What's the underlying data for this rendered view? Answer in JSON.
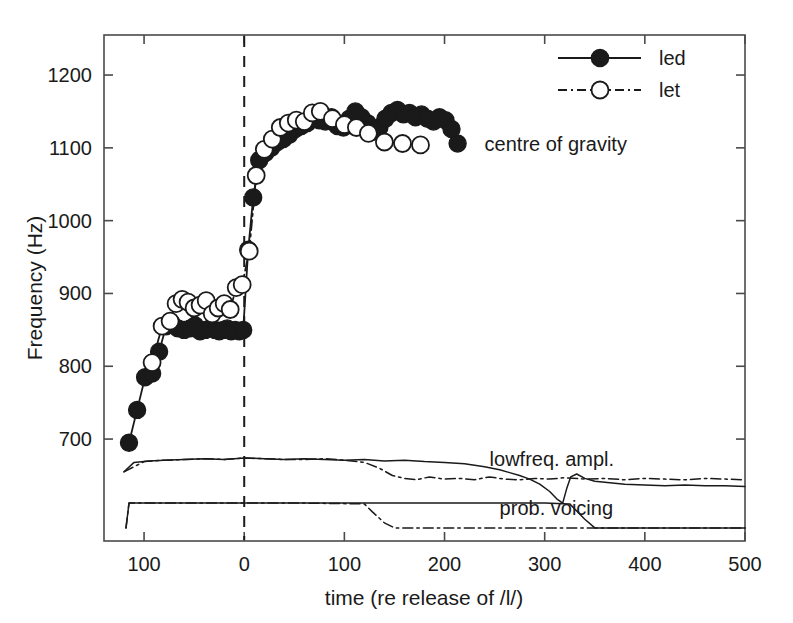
{
  "chart_data": {
    "type": "line",
    "title": "",
    "xlabel": "time (re release of /l/)",
    "ylabel": "Frequency (Hz)",
    "xlim": [
      -140,
      500
    ],
    "ylim": [
      560,
      1255
    ],
    "xticks": [
      -100,
      0,
      100,
      200,
      300,
      400,
      500
    ],
    "xticklabels": [
      "100",
      "0",
      "100",
      "200",
      "300",
      "400",
      "500"
    ],
    "yticks": [
      700,
      800,
      900,
      1000,
      1100,
      1200
    ],
    "yticklabels": [
      "700",
      "800",
      "900",
      "1000",
      "1100",
      "1200"
    ],
    "grid": false,
    "legend_position": "top-right",
    "legend": [
      {
        "name": "led",
        "marker": "filled-circle",
        "line": "solid"
      },
      {
        "name": "let",
        "marker": "open-circle",
        "line": "dash-dot"
      }
    ],
    "annotations": [
      {
        "text": "centre of gravity",
        "x": 240,
        "y": 1105
      },
      {
        "text": "lowfreq. ampl.",
        "x": 245,
        "y": 672
      },
      {
        "text": "prob. voicing",
        "x": 255,
        "y": 605
      }
    ],
    "reference_lines": [
      {
        "orientation": "vertical",
        "x": 0,
        "style": "dashed",
        "label": "release of /l/"
      }
    ],
    "series": [
      {
        "name": "led",
        "marker": "filled-circle",
        "line": "solid",
        "panel": "centre of gravity",
        "x": [
          -115,
          -107,
          -99,
          -92,
          -85,
          -78,
          -72,
          -66,
          -60,
          -54,
          -49,
          -44,
          -39,
          -34,
          -29,
          -25,
          -21,
          -17,
          -13,
          -9,
          -5,
          -1,
          4,
          9,
          15,
          21,
          27,
          33,
          39,
          45,
          51,
          57,
          63,
          69,
          75,
          81,
          87,
          93,
          99,
          105,
          111,
          117,
          123,
          129,
          135,
          141,
          147,
          153,
          159,
          165,
          171,
          177,
          183,
          189,
          195,
          201,
          207,
          213
        ],
        "y": [
          695,
          740,
          785,
          790,
          820,
          855,
          858,
          852,
          850,
          852,
          856,
          848,
          850,
          852,
          850,
          848,
          850,
          852,
          848,
          850,
          848,
          850,
          960,
          1032,
          1083,
          1093,
          1100,
          1108,
          1112,
          1118,
          1126,
          1130,
          1134,
          1142,
          1138,
          1136,
          1142,
          1130,
          1128,
          1140,
          1150,
          1142,
          1134,
          1122,
          1128,
          1140,
          1148,
          1152,
          1146,
          1148,
          1142,
          1146,
          1140,
          1136,
          1142,
          1138,
          1126,
          1106
        ]
      },
      {
        "name": "let",
        "marker": "open-circle",
        "line": "dash-dot",
        "panel": "centre of gravity",
        "x": [
          -92,
          -82,
          -74,
          -68,
          -62,
          -56,
          -50,
          -44,
          -38,
          -32,
          -26,
          -20,
          -14,
          -8,
          -2,
          5,
          12,
          20,
          28,
          36,
          44,
          52,
          60,
          68,
          76,
          88,
          100,
          112,
          124,
          140,
          158,
          176
        ],
        "y": [
          805,
          855,
          862,
          886,
          892,
          888,
          880,
          884,
          890,
          872,
          880,
          886,
          878,
          908,
          912,
          958,
          1062,
          1098,
          1112,
          1128,
          1134,
          1138,
          1136,
          1148,
          1150,
          1140,
          1132,
          1128,
          1120,
          1108,
          1106,
          1104
        ]
      },
      {
        "name": "led",
        "line": "solid",
        "panel": "lowfreq. ampl.",
        "description": "low-frequency amplitude envelope, flat near 672 Hz equivalent until t=250, then gradual decline with a sharp dip near t=320 and recovery to a lower plateau through t=500",
        "x": [
          -120,
          -110,
          -95,
          -80,
          -60,
          -40,
          -20,
          0,
          20,
          40,
          60,
          80,
          100,
          120,
          140,
          160,
          180,
          200,
          220,
          240,
          255,
          265,
          275,
          285,
          295,
          305,
          312,
          318,
          322,
          326,
          332,
          340,
          350,
          365,
          380,
          400,
          420,
          440,
          460,
          480,
          500
        ],
        "y": [
          655,
          668,
          670,
          671,
          672,
          673,
          672,
          674,
          673,
          672,
          673,
          672,
          671,
          672,
          670,
          671,
          669,
          668,
          666,
          662,
          658,
          654,
          650,
          645,
          638,
          628,
          618,
          612,
          632,
          648,
          652,
          646,
          642,
          640,
          638,
          637,
          636,
          637,
          636,
          636,
          635
        ]
      },
      {
        "name": "let",
        "line": "dash-dot",
        "panel": "lowfreq. ampl.",
        "description": "low-frequency amplitude envelope, overlaps led until t=125, then declines to a lower noisy plateau near 645 Hz equivalent",
        "x": [
          -120,
          -100,
          -80,
          -60,
          -40,
          -20,
          0,
          20,
          40,
          60,
          80,
          100,
          120,
          135,
          148,
          160,
          172,
          185,
          200,
          215,
          230,
          245,
          260,
          275,
          290,
          305,
          320,
          340,
          360,
          380,
          400,
          420,
          440,
          460,
          480,
          500
        ],
        "y": [
          655,
          669,
          671,
          672,
          673,
          672,
          674,
          673,
          672,
          672,
          673,
          671,
          668,
          660,
          650,
          646,
          644,
          648,
          645,
          646,
          644,
          648,
          645,
          644,
          646,
          645,
          647,
          645,
          646,
          644,
          646,
          645,
          644,
          646,
          645,
          644
        ]
      },
      {
        "name": "led",
        "line": "solid",
        "panel": "prob. voicing",
        "description": "probability of voicing, steps up at t=-115, stays high until t=335, then falls to the low level through t=500",
        "x": [
          -118,
          -115,
          -100,
          0,
          100,
          200,
          300,
          325,
          340,
          350,
          400,
          450,
          500
        ],
        "y": [
          578,
          612,
          612,
          612,
          612,
          612,
          612,
          611,
          590,
          578,
          578,
          578,
          578
        ]
      },
      {
        "name": "let",
        "line": "dash-dot",
        "panel": "prob. voicing",
        "description": "probability of voicing, high until t=125, falls to the low level and remains there through t=500",
        "x": [
          -118,
          -115,
          -60,
          0,
          60,
          120,
          128,
          140,
          150,
          200,
          260,
          320,
          380,
          440,
          500
        ],
        "y": [
          578,
          612,
          612,
          612,
          612,
          611,
          600,
          585,
          578,
          578,
          578,
          578,
          578,
          578,
          578
        ]
      }
    ]
  },
  "colors": {
    "ink": "#1a1a1a",
    "axis": "#4a4a4a",
    "background": "#ffffff"
  }
}
